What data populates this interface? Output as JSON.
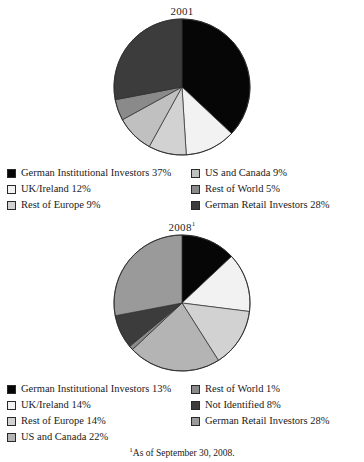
{
  "figures": [
    {
      "id": "shareholder-structure-2001",
      "title": "2001",
      "title_superscript": "",
      "legend_left": [
        {
          "label": "German Institutional Investors 37%",
          "color": "#060606"
        },
        {
          "label": "UK/Ireland 12%",
          "color": "#f2f2f2"
        },
        {
          "label": "Rest of Europe 9%",
          "color": "#d2d2d2"
        }
      ],
      "legend_right": [
        {
          "label": "US and Canada 9%",
          "color": "#c0c0c0"
        },
        {
          "label": "Rest of World 5%",
          "color": "#8a8a8a"
        },
        {
          "label": "German Retail Investors 28%",
          "color": "#3c3c3c"
        }
      ]
    },
    {
      "id": "shareholder-structure-2008",
      "title": "2008",
      "title_superscript": "1",
      "legend_left": [
        {
          "label": "German Institutional Investors 13%",
          "color": "#060606"
        },
        {
          "label": "UK/Ireland 14%",
          "color": "#f2f2f2"
        },
        {
          "label": "Rest of Europe 14%",
          "color": "#d2d2d2"
        },
        {
          "label": "US and Canada 22%",
          "color": "#b4b4b4"
        }
      ],
      "legend_right": [
        {
          "label": "Rest of World 1%",
          "color": "#8a8a8a"
        },
        {
          "label": "Not Identified 8%",
          "color": "#3c3c3c"
        },
        {
          "label": "German Retail Investors 28%",
          "color": "#9a9a9a"
        }
      ]
    }
  ],
  "footnote": {
    "marker": "1",
    "text": "As of September 30, 2008."
  },
  "chart_data": [
    {
      "type": "pie",
      "title": "2001",
      "xlabel": "",
      "ylabel": "",
      "legend_position": "bottom",
      "start_angle_deg": 0,
      "direction": "clockwise",
      "categories": [
        "German Institutional Investors",
        "UK/Ireland",
        "Rest of Europe",
        "US and Canada",
        "Rest of World",
        "German Retail Investors"
      ],
      "values": [
        37,
        12,
        9,
        9,
        5,
        28
      ],
      "unit": "%",
      "colors": [
        "#060606",
        "#f2f2f2",
        "#d2d2d2",
        "#c0c0c0",
        "#8a8a8a",
        "#3c3c3c"
      ]
    },
    {
      "type": "pie",
      "title": "2008",
      "xlabel": "",
      "ylabel": "",
      "legend_position": "bottom",
      "start_angle_deg": 0,
      "direction": "clockwise",
      "categories": [
        "German Institutional Investors",
        "UK/Ireland",
        "Rest of Europe",
        "US and Canada",
        "Rest of World",
        "Not Identified",
        "German Retail Investors"
      ],
      "values": [
        13,
        14,
        14,
        22,
        1,
        8,
        28
      ],
      "unit": "%",
      "colors": [
        "#060606",
        "#f2f2f2",
        "#d2d2d2",
        "#b4b4b4",
        "#8a8a8a",
        "#3c3c3c",
        "#9a9a9a"
      ],
      "annotations": [
        "1 = As of September 30, 2008."
      ]
    }
  ]
}
